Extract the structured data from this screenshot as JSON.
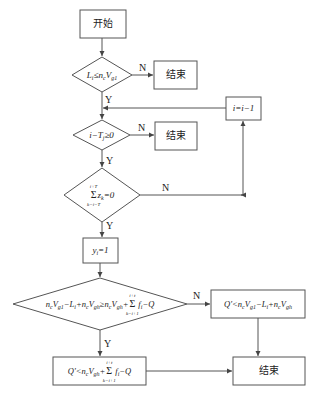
{
  "diagram": {
    "type": "flowchart",
    "nodes": {
      "start": {
        "label": "开始"
      },
      "cond1": {
        "L": "L",
        "L_sub": "i",
        "op": "≤",
        "n": "n",
        "n_sub": "c",
        "V": "V",
        "V_sub": "g1"
      },
      "end1": {
        "label": "结束"
      },
      "decrement": {
        "label": "i=i−1"
      },
      "cond2": {
        "lhs": "i−T",
        "lhs_sub": "j",
        "op": "≥0"
      },
      "end2": {
        "label": "结束"
      },
      "cond3": {
        "sum": "Σ",
        "sum_top": "i+T",
        "sum_bot": "k=i−T",
        "z": "z",
        "z_sub": "k",
        "rhs": "=0"
      },
      "assign": {
        "y": "y",
        "y_sub": "i",
        "rhs": "=1"
      },
      "cond4": {
        "text": "n_c V_g1 − L_i + n_c V_gh ≥ n_c V_gh + Σ_{k=i+1}^{i+t} f_i − Q",
        "p1": "n",
        "p1s": "c",
        "p2": "V",
        "p2s": "g1",
        "p3": "−L",
        "p3s": "i",
        "p4": "+n",
        "p4s": "c",
        "p5": "V",
        "p5s": "gh",
        "op": "≥n",
        "p6s": "c",
        "p7": "V",
        "p7s": "gh",
        "plus": "+",
        "sum_top": "i+t",
        "sum_bot": "k=i+1",
        "f": "f",
        "fs": "i",
        "tail": "−Q"
      },
      "result_n": {
        "text": "Q′<n_c V_g1 − L_i + n_c V_gh",
        "q": "Q′<n",
        "qs": "c",
        "v1": "V",
        "v1s": "g1",
        "l": "−L",
        "ls": "i",
        "n2": "+n",
        "n2s": "c",
        "v2": "V",
        "v2s": "gh"
      },
      "result_y": {
        "text": "Q′<n_c V_gh + Σ_{k=i+1}^{i+t} f_i − Q",
        "q": "Q′<n",
        "qs": "c",
        "v": "V",
        "vs": "gh",
        "plus": "+",
        "sum_top": "i+t",
        "sum_bot": "k=i+1",
        "f": "f",
        "fs": "i",
        "tail": "−Q"
      },
      "end3": {
        "label": "结束"
      }
    },
    "edge_labels": {
      "c1_no": "N",
      "c1_yes": "Y",
      "c2_no": "N",
      "c2_yes": "Y",
      "c3_no": "N",
      "c3_yes": "Y",
      "c4_no": "N",
      "c4_yes": "Y"
    },
    "colors": {
      "stroke": "#555555",
      "text": "#222222",
      "background": "#ffffff"
    }
  }
}
